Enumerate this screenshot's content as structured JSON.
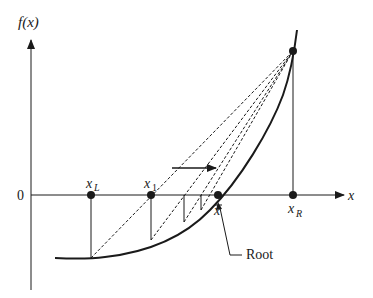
{
  "diagram": {
    "y_axis_label": "f(x)",
    "x_axis_label": "x",
    "origin_label": "0",
    "points": [
      {
        "id": "xL",
        "label_main": "x",
        "label_sub": "L",
        "x": 91
      },
      {
        "id": "x1",
        "label_main": "x",
        "label_sub": "1",
        "x": 151
      },
      {
        "id": "xbar",
        "label_main": "x",
        "label_sub": "",
        "overbar": true,
        "x": 218
      },
      {
        "id": "xR",
        "label_main": "x",
        "label_sub": "R",
        "x": 293
      }
    ],
    "root_label": "Root",
    "colors": {
      "ink": "#1a1a1a",
      "background": "#ffffff"
    }
  }
}
